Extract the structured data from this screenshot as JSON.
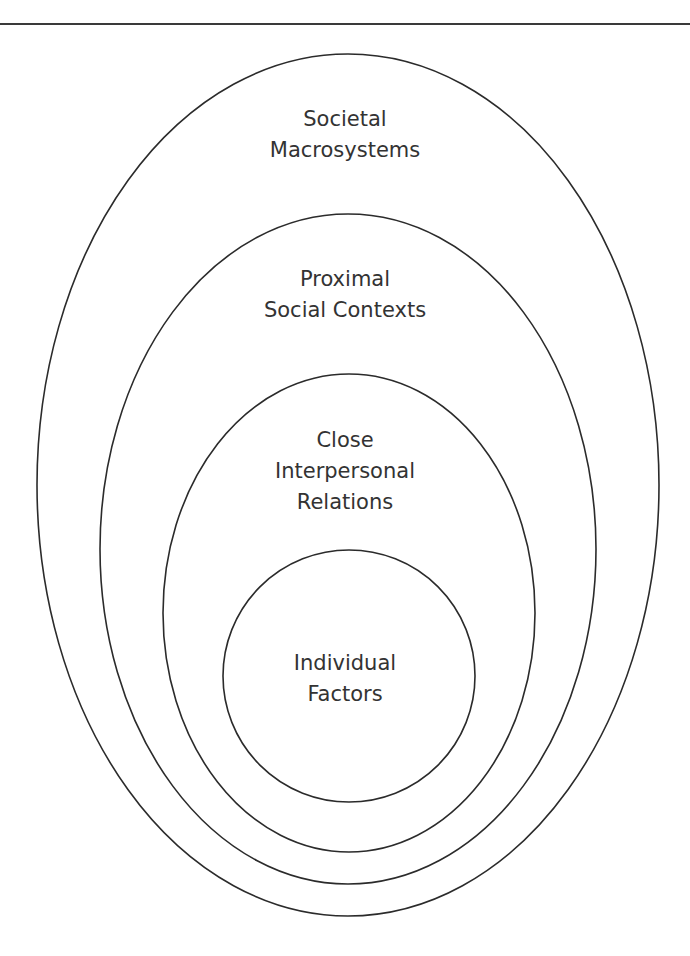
{
  "diagram": {
    "type": "nested-ellipses",
    "stroke_color": "#2b2b2b",
    "text_color": "#333333",
    "layers": [
      {
        "name": "societal-macrosystems",
        "lines": [
          "Societal",
          "Macrosystems"
        ]
      },
      {
        "name": "proximal-social-contexts",
        "lines": [
          "Proximal",
          "Social Contexts"
        ]
      },
      {
        "name": "close-interpersonal-relations",
        "lines": [
          "Close",
          "Interpersonal",
          "Relations"
        ]
      },
      {
        "name": "individual-factors",
        "lines": [
          "Individual",
          "Factors"
        ]
      }
    ]
  }
}
